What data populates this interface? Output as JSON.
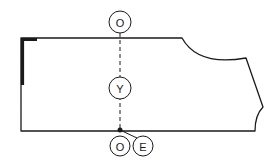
{
  "diagram": {
    "type": "pattern-piece",
    "stroke_color": "#1a1a1a",
    "background": "#ffffff",
    "markers": [
      {
        "id": "top",
        "label": "O",
        "cx": 120,
        "cy": 22
      },
      {
        "id": "middle",
        "label": "Y",
        "cx": 120,
        "cy": 88
      },
      {
        "id": "bottom-left",
        "label": "O",
        "cx": 120,
        "cy": 146
      },
      {
        "id": "bottom-right",
        "label": "E",
        "cx": 143,
        "cy": 146
      }
    ]
  }
}
